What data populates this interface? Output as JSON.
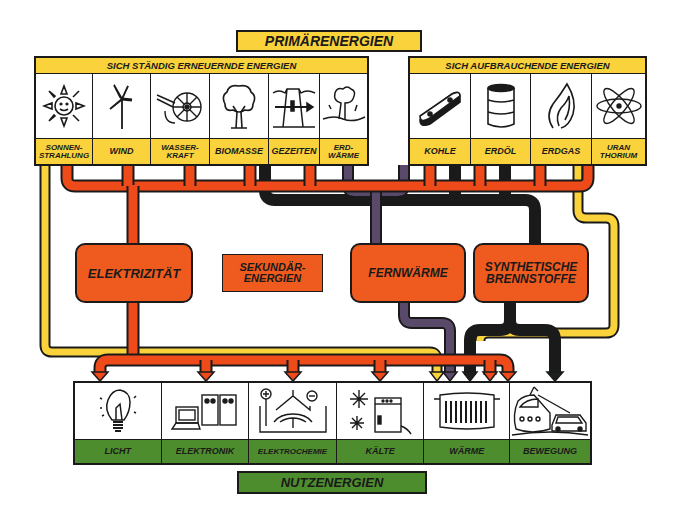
{
  "title": "PRIMÄRENERGIEN",
  "groups": {
    "renewable": {
      "heading": "SICH STÄNDIG ERNEUERNDE ENERGIEN",
      "sources": [
        {
          "label": "SONNEN-\nSTRAHLUNG",
          "icon": "sun-icon"
        },
        {
          "label": "WIND",
          "icon": "wind-turbine-icon"
        },
        {
          "label": "WASSER-\nKRAFT",
          "icon": "water-wheel-icon"
        },
        {
          "label": "BIOMASSE",
          "icon": "tree-icon"
        },
        {
          "label": "GEZEITEN",
          "icon": "tide-dam-icon"
        },
        {
          "label": "ERD-\nWÄRME",
          "icon": "geyser-icon"
        }
      ]
    },
    "depleting": {
      "heading": "SICH AUFBRAUCHENDE ENERGIEN",
      "sources": [
        {
          "label": "KOHLE",
          "icon": "coal-briquette-icon"
        },
        {
          "label": "ERDÖL",
          "icon": "oil-barrel-icon"
        },
        {
          "label": "ERDGAS",
          "icon": "gas-flame-icon"
        },
        {
          "label": "URAN\nTHORIUM",
          "icon": "atom-icon"
        }
      ]
    }
  },
  "secondary": {
    "caption": "SEKUNDÄR-\nENERGIEN",
    "nodes": [
      {
        "label": "ELEKTRIZITÄT"
      },
      {
        "label": "FERNWÄRME"
      },
      {
        "label": "SYNTHETISCHE\nBRENNSTOFFE"
      }
    ]
  },
  "uses": {
    "footer": "NUTZENERGIEN",
    "items": [
      {
        "label": "LICHT",
        "icon": "light-bulb-icon"
      },
      {
        "label": "ELEKTRONIK",
        "icon": "computer-icon"
      },
      {
        "label": "ELEKTROCHEMIE",
        "icon": "electrolysis-icon"
      },
      {
        "label": "KÄLTE",
        "icon": "refrigerator-snowflake-icon"
      },
      {
        "label": "WÄRME",
        "icon": "radiator-icon"
      },
      {
        "label": "BEWEGUNG",
        "icon": "train-car-icon"
      }
    ]
  },
  "colors": {
    "primary_yellow": "#f9d23c",
    "electricity_red": "#ef4a1a",
    "hub_orange": "#ef5a1f",
    "district_heat_purple": "#5a4a6a",
    "fuel_black": "#1a1e1c",
    "useful_green": "#4e8d2e"
  }
}
